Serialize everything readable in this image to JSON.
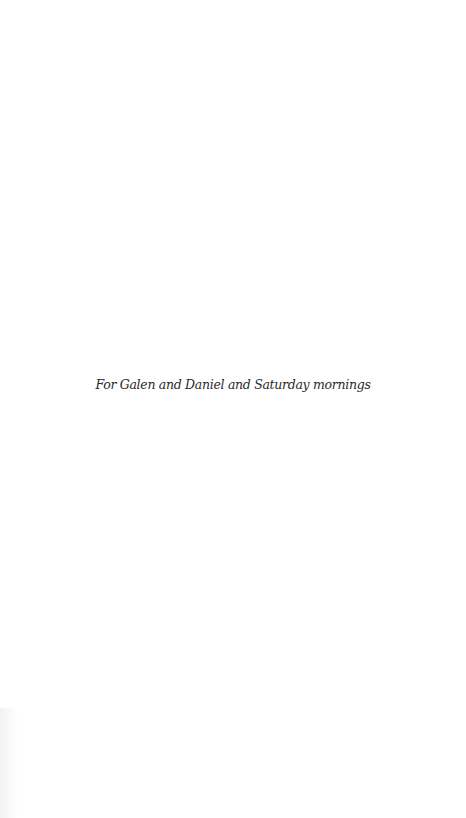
{
  "page": {
    "dedication": "For Galen and Daniel and Saturday mornings"
  },
  "colors": {
    "background": "#ffffff",
    "text": "#2a2a2a"
  }
}
